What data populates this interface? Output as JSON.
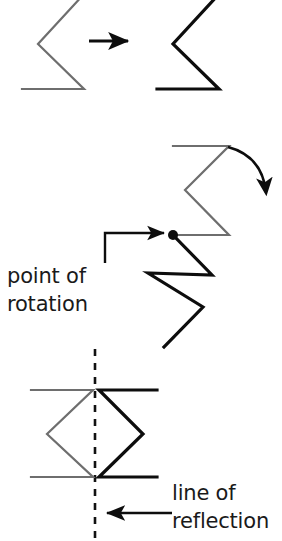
{
  "figure": {
    "background_color": "#ffffff",
    "colors": {
      "preimage_gray": "#6e6e6e",
      "image_black": "#0d0d0d",
      "text_black": "#1a1a1a",
      "dashed_line": "#111111"
    },
    "panels": [
      {
        "id": "translation",
        "name": "translation-panel",
        "label": "",
        "preimage": {
          "name": "translation-preimage-shape",
          "color": "#6e6e6e",
          "stroke_width": 2.2,
          "points": "22,-6 84,-6 38,44 84,89 22,89"
        },
        "image": {
          "name": "translation-image-shape",
          "color": "#0d0d0d",
          "stroke_width": 3.2,
          "points": "157,-6 219,-6 173,44 219,89 157,89"
        },
        "arrow": {
          "name": "translation-arrow",
          "x1": 89,
          "y1": 41,
          "x2": 131,
          "y2": 41
        }
      },
      {
        "id": "rotation",
        "name": "rotation-panel",
        "preimage": {
          "name": "rotation-preimage-shape",
          "color": "#6e6e6e",
          "stroke_width": 2.2,
          "points": "173,146 229,146 185,190 229,235 173,235"
        },
        "image": {
          "name": "rotation-image-shape",
          "color": "#0d0d0d",
          "stroke_width": 3.2,
          "points": "173,235 212,275 148,273 203,307 164,347"
        },
        "pivot": {
          "name": "rotation-point-dot",
          "cx": 173,
          "cy": 235,
          "r": 5
        },
        "curved_arrow": {
          "name": "rotation-curved-arrow",
          "path": "M 228,147 Q 262,156 266,192"
        },
        "pointer": {
          "name": "point-of-rotation-pointer",
          "path": "M 105,263 L 105,233 L 164,233"
        },
        "label_lines": [
          "point of",
          "rotation"
        ],
        "label_x": 7,
        "label_y1": 283,
        "label_y2": 311
      },
      {
        "id": "reflection",
        "name": "reflection-panel",
        "preimage": {
          "name": "reflection-preimage-shape",
          "color": "#6e6e6e",
          "stroke_width": 2.2,
          "points": "31,390 93,390 47,434 93,477 31,477"
        },
        "image": {
          "name": "reflection-image-shape",
          "color": "#0d0d0d",
          "stroke_width": 3.2,
          "points": "157,390 99,390 143,434 99,477 157,477"
        },
        "mirror_line": {
          "name": "line-of-reflection-dashed-line",
          "x": 95,
          "y1": 349,
          "y2": 541,
          "dash": "7 7"
        },
        "arrow": {
          "name": "line-of-reflection-arrow",
          "x1": 172,
          "y1": 513,
          "x2": 104,
          "y2": 513
        },
        "label_lines": [
          "line of",
          "reflection"
        ],
        "label_x": 172,
        "label_y1": 500,
        "label_y2": 528
      }
    ]
  }
}
